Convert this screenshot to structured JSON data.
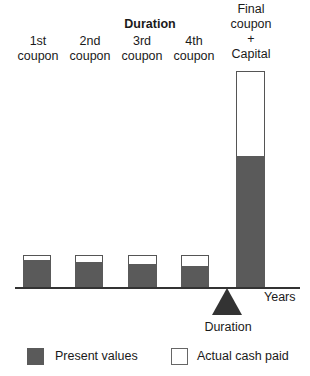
{
  "diagram": {
    "title": "Duration",
    "colors": {
      "present_value": "#5a5a5a",
      "cash_paid": "#ffffff",
      "outline": "#555555"
    },
    "payments": [
      {
        "label_line1": "1st",
        "label_line2": "coupon",
        "cash_height": 32,
        "pv_height": 27
      },
      {
        "label_line1": "2nd",
        "label_line2": "coupon",
        "cash_height": 32,
        "pv_height": 25
      },
      {
        "label_line1": "3rd",
        "label_line2": "coupon",
        "cash_height": 32,
        "pv_height": 23
      },
      {
        "label_line1": "4th",
        "label_line2": "coupon",
        "cash_height": 32,
        "pv_height": 21
      },
      {
        "label_line1": "Final",
        "label_line2": "coupon",
        "label_line3": "+",
        "label_line4": "Capital",
        "cash_height": 216,
        "pv_height": 131
      }
    ],
    "x_axis_label": "Years",
    "duration_marker_label": "Duration",
    "legend": [
      {
        "label": "Present values",
        "swatch": "filled"
      },
      {
        "label": "Actual cash paid",
        "swatch": "empty"
      }
    ]
  }
}
